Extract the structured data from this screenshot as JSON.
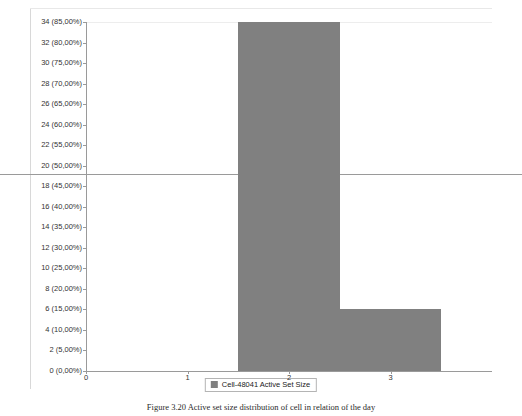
{
  "chart_data": {
    "type": "bar",
    "title": "",
    "xlabel": "",
    "ylabel": "",
    "categories": [
      "2",
      "3"
    ],
    "bins": [
      {
        "x_start": 1.5,
        "x_end": 2.5,
        "value": 34,
        "percent": "85,00%"
      },
      {
        "x_start": 2.5,
        "x_end": 3.5,
        "value": 6,
        "percent": "15,00%"
      }
    ],
    "values": [
      34,
      6
    ],
    "xlim": [
      0,
      4
    ],
    "ylim": [
      0,
      34
    ],
    "grid": false,
    "legend_position": "bottom-center",
    "series": [
      {
        "name": "Cell-48041 Active Set Size",
        "values": [
          34,
          6
        ],
        "color": "#808080"
      }
    ],
    "x_ticks": [
      "0",
      "1",
      "2",
      "3"
    ],
    "x_tick_values": [
      0,
      1,
      2,
      3
    ],
    "y_ticks": [
      "34 (85,00%)",
      "32 (80,00%)",
      "30 (75,00%)",
      "28 (70,00%)",
      "26 (65,00%)",
      "24 (60,00%)",
      "22 (55,00%)",
      "20 (50,00%)",
      "18 (45,00%)",
      "16 (40,00%)",
      "14 (35,00%)",
      "12 (30,00%)",
      "10 (25,00%)",
      "8 (20,00%)",
      "6 (15,00%)",
      "4 (10,00%)",
      "2 (5,00%)",
      "0 (0,00%)"
    ],
    "y_tick_values": [
      34,
      32,
      30,
      28,
      26,
      24,
      22,
      20,
      18,
      16,
      14,
      12,
      10,
      8,
      6,
      4,
      2,
      0
    ],
    "annotations": [
      {
        "type": "horizontal-rule",
        "y_value": 20,
        "label": "20 (50,00%)"
      }
    ],
    "colors": {
      "bar": "#808080",
      "axis": "#9a9a9a",
      "rule": "#9a9a9a",
      "text": "#333333",
      "background": "#ffffff"
    }
  },
  "legend": {
    "entries": [
      {
        "label": "Cell-48041 Active Set Size",
        "color": "#808080"
      }
    ]
  },
  "caption": {
    "figure_number": "Figure 3.20",
    "text": "Figure 3.20  Active set size distribution of cell in relation of the day"
  }
}
